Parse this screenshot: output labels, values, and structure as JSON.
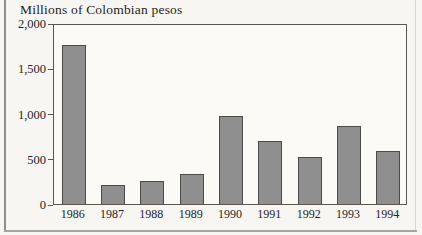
{
  "figure": {
    "title": "Millions of Colombian pesos"
  },
  "chart_data": {
    "type": "bar",
    "title": "Millions of Colombian pesos",
    "xlabel": "",
    "ylabel": "Millions of Colombian pesos",
    "categories": [
      "1986",
      "1987",
      "1988",
      "1989",
      "1990",
      "1991",
      "1992",
      "1993",
      "1994"
    ],
    "values": [
      1760,
      205,
      260,
      335,
      975,
      700,
      520,
      860,
      590
    ],
    "ylim": [
      0,
      2000
    ],
    "yticks": [
      0,
      500,
      1000,
      1500,
      2000
    ],
    "ytick_labels": [
      "0",
      "500",
      "1,000",
      "1,500",
      "2,000"
    ],
    "grid": false,
    "legend": "none",
    "bar_color": "#8f8f8f",
    "bar_border_color": "#4b4b4b",
    "axis_color": "#5b5650",
    "text_color": "#26231e"
  }
}
